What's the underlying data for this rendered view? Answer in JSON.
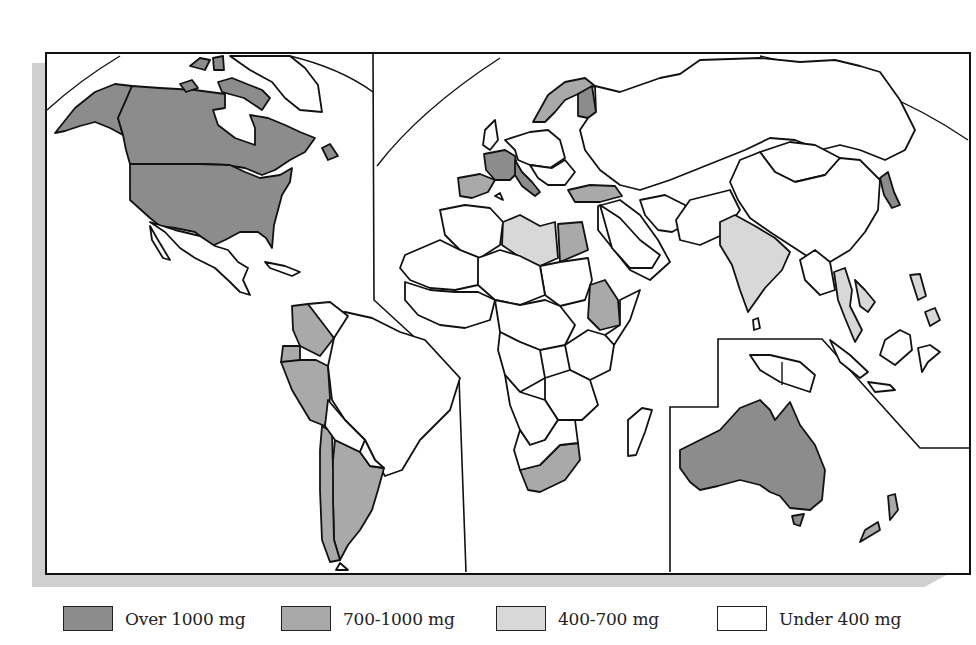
{
  "figure": {
    "type": "choropleth world map",
    "panels": [
      "Americas",
      "Europe, Africa and Asia",
      "Oceania"
    ]
  },
  "colors": {
    "over_1000": "#8c8c8c",
    "700_1000": "#a9a9a9",
    "400_700": "#d8d8d8",
    "under_400": "#ffffff",
    "outline": "#111111",
    "shadow": "#cfcfcf"
  },
  "legend": {
    "items": [
      {
        "key": "over_1000",
        "label": "Over 1000 mg",
        "color": "#8c8c8c"
      },
      {
        "key": "700_1000",
        "label": "700-1000 mg",
        "color": "#a9a9a9"
      },
      {
        "key": "400_700",
        "label": "400-700 mg",
        "color": "#d8d8d8"
      },
      {
        "key": "under_400",
        "label": "Under 400 mg",
        "color": "#ffffff"
      }
    ]
  },
  "regions": {
    "over_1000": [
      "Alaska/USA",
      "Canada",
      "United States",
      "Greenland islands (Canadian Arctic)",
      "France",
      "Italy",
      "Finland",
      "Australia",
      "Japan (north)"
    ],
    "700_1000": [
      "Spain",
      "Turkey",
      "Egypt",
      "Ethiopia",
      "South Africa",
      "Colombia",
      "Ecuador",
      "Peru",
      "Chile",
      "Argentina",
      "Norway/Sweden",
      "New Zealand",
      "Tasmania"
    ],
    "400_700": [
      "Libya",
      "India",
      "Thailand",
      "Vietnam",
      "Philippines"
    ],
    "under_400": [
      "Rest of world"
    ]
  }
}
